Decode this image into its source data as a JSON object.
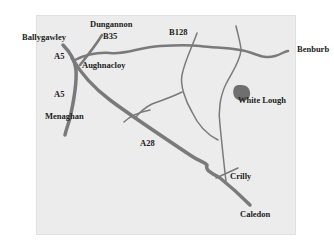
{
  "map": {
    "colors": {
      "background": "#ececec",
      "road": "#7a7a7a",
      "lake": "#6f6f6f",
      "label": "#222222"
    },
    "places": [
      {
        "id": "dungannon",
        "name": "Dungannon"
      },
      {
        "id": "ballygawley",
        "name": "Ballygawley"
      },
      {
        "id": "aughnacloy",
        "name": "Aughnacloy"
      },
      {
        "id": "menaghan",
        "name": "Menaghan"
      },
      {
        "id": "benburb",
        "name": "Benburb"
      },
      {
        "id": "white-lough",
        "name": "White Lough"
      },
      {
        "id": "crilly",
        "name": "Crilly"
      },
      {
        "id": "caledon",
        "name": "Caledon"
      }
    ],
    "roads": [
      {
        "id": "b35",
        "name": "B35"
      },
      {
        "id": "b128",
        "name": "B128"
      },
      {
        "id": "a5-north",
        "name": "A5"
      },
      {
        "id": "a5-south",
        "name": "A5"
      },
      {
        "id": "a28",
        "name": "A28"
      }
    ]
  }
}
